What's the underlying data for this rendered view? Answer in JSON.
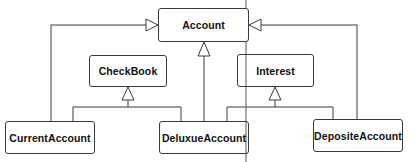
{
  "diagram": {
    "type": "uml-class-inheritance",
    "classes": [
      {
        "id": "account",
        "name": "Account"
      },
      {
        "id": "checkbook",
        "name": "CheckBook"
      },
      {
        "id": "interest",
        "name": "Interest"
      },
      {
        "id": "current",
        "name": "CurrentAccount"
      },
      {
        "id": "deluxue",
        "name": "DeluxueAccount"
      },
      {
        "id": "deposite",
        "name": "DepositeAccount"
      }
    ],
    "relations": [
      {
        "from": "CurrentAccount",
        "to": "Account",
        "kind": "generalization"
      },
      {
        "from": "CurrentAccount",
        "to": "CheckBook",
        "kind": "generalization"
      },
      {
        "from": "DeluxueAccount",
        "to": "CheckBook",
        "kind": "generalization"
      },
      {
        "from": "DeluxueAccount",
        "to": "Account",
        "kind": "generalization"
      },
      {
        "from": "DeluxueAccount",
        "to": "Interest",
        "kind": "generalization"
      },
      {
        "from": "DepositeAccount",
        "to": "Interest",
        "kind": "generalization"
      },
      {
        "from": "DepositeAccount",
        "to": "Account",
        "kind": "generalization"
      }
    ],
    "colors": {
      "line": "#3a3a3a",
      "box_border": "#3a3a3a",
      "background": "#ffffff"
    }
  }
}
